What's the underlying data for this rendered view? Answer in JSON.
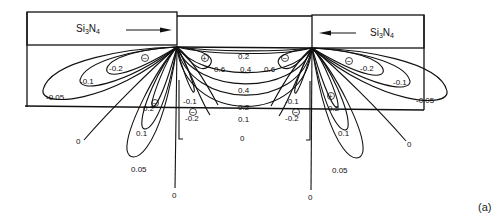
{
  "figure": {
    "panel_label": "(a)",
    "regions": {
      "left_nitride": {
        "label_main": "Si",
        "label_sub1": "3",
        "label_mid": "N",
        "label_sub2": "4",
        "arrow_direction": "right"
      },
      "right_nitride": {
        "label_main": "Si",
        "label_sub1": "3",
        "label_mid": "N",
        "label_sub2": "4",
        "arrow_direction": "left"
      }
    },
    "contour_labels": {
      "left": {
        "neg_lobe": [
          "-0.2",
          "-0.1",
          "-0.05"
        ],
        "pos_lobe": [
          "0.2",
          "0.1",
          "0.05"
        ],
        "zero_diag": "0",
        "zero_vert": "0",
        "inner_neg": [
          "-0.1",
          "-0.2"
        ]
      },
      "center": {
        "top_row": "0.2",
        "middle_row": [
          "0.6",
          "0.4",
          "0.6"
        ],
        "rows": [
          "0.4",
          "0.2",
          "0.1",
          "0"
        ]
      },
      "right": {
        "neg_lobe": [
          "-0.2",
          "-0.1",
          "-0.05"
        ],
        "pos_lobe": [
          "0.2",
          "0.1",
          "0.05"
        ],
        "zero_diag": "0",
        "zero_vert": "0",
        "inner_neg": [
          "-0.1",
          "-0.2"
        ]
      }
    },
    "signs": {
      "minus": "−",
      "plus": "+"
    }
  }
}
